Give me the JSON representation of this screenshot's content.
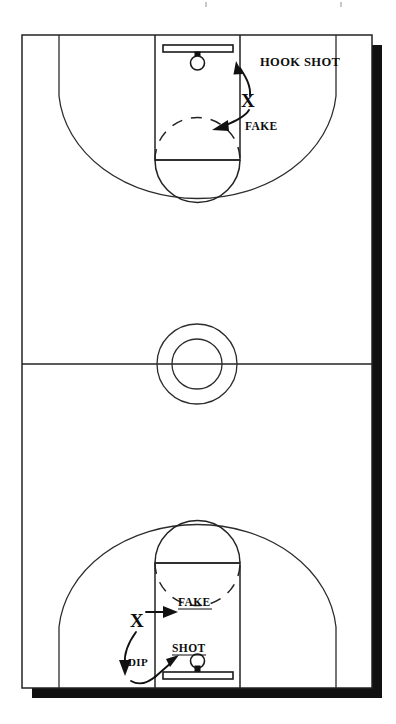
{
  "diagram": {
    "title": "Basketball Full Court Play Diagram",
    "type": "basketball-court-play-diagram",
    "colors": {
      "line": "#232323",
      "shadow": "#111111",
      "court": "#ffffff",
      "text": "#0d0d0d"
    },
    "court": {
      "orientation": "vertical-full-court",
      "left": 22,
      "top": 35,
      "right": 372,
      "bottom": 688,
      "midcourt_y": 364,
      "shadow_offset": 10
    },
    "halves": [
      {
        "name": "top-half",
        "hoop": {
          "backboard_label": "backboard",
          "rim_label": "rim"
        },
        "labels": [
          {
            "key": "hook_shot",
            "text": "HOOK SHOT"
          },
          {
            "key": "fake",
            "text": "FAKE"
          }
        ],
        "player_marker": "X"
      },
      {
        "name": "bottom-half",
        "hoop": {
          "backboard_label": "backboard",
          "rim_label": "rim"
        },
        "labels": [
          {
            "key": "fake",
            "text": "FAKE"
          },
          {
            "key": "dip",
            "text": "DIP"
          },
          {
            "key": "shot",
            "text": "SHOT"
          }
        ],
        "player_marker": "X"
      }
    ],
    "labels": {
      "hook_shot": "HOOK SHOT",
      "fake_top": "FAKE",
      "fake_bottom": "FAKE",
      "dip": "DIP",
      "shot": "SHOT",
      "marker_top": "X",
      "marker_bottom": "X"
    },
    "court_features": [
      "baseline",
      "sideline",
      "midcourt-line",
      "center-circle-outer",
      "center-circle-inner",
      "three-point-arc-top",
      "three-point-arc-bottom",
      "lane-top",
      "lane-bottom",
      "free-throw-line-top",
      "free-throw-line-bottom",
      "free-throw-circle-top",
      "free-throw-circle-bottom",
      "backboard-top",
      "backboard-bottom",
      "rim-top",
      "rim-bottom"
    ]
  }
}
